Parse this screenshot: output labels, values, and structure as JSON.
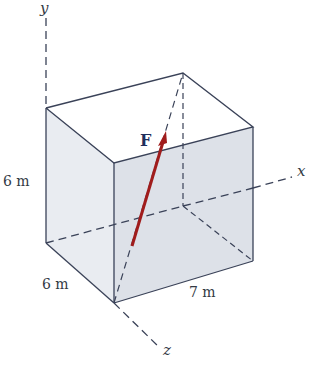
{
  "figure": {
    "axes": {
      "x": "x",
      "y": "y",
      "z": "z"
    },
    "force": {
      "label": "F",
      "color": "#a01c1c"
    },
    "dimensions": {
      "height": "6 m",
      "depth": "6 m",
      "width": "7 m"
    },
    "colors": {
      "edge": "#3a4258",
      "face_front": "#dfe3ea",
      "face_side": "#e9ecf1",
      "dashed": "#3a4258"
    }
  }
}
